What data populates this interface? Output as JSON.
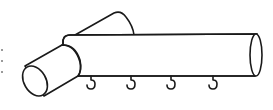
{
  "figure": {
    "stroke_color": "#1a1a1a",
    "background": "#ffffff",
    "hooks": [
      {
        "x": 91
      },
      {
        "x": 131
      },
      {
        "x": 171
      },
      {
        "x": 213
      }
    ],
    "edge_marks": [
      {
        "y": 50
      },
      {
        "y": 61
      },
      {
        "y": 72
      }
    ]
  }
}
